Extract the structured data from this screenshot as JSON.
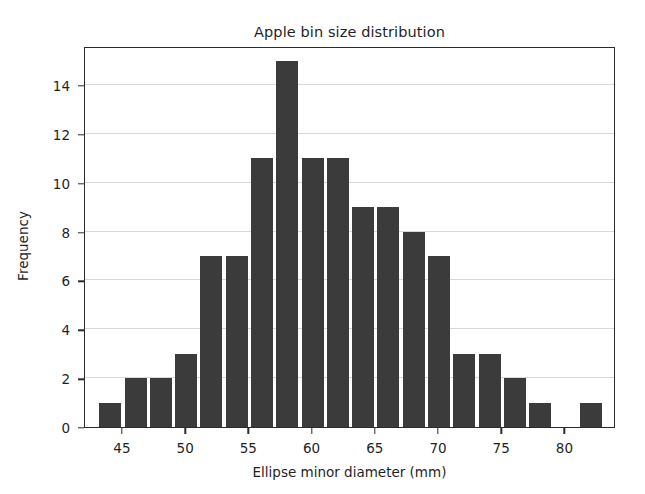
{
  "chart_data": {
    "type": "bar",
    "title": "Apple bin size distribution",
    "xlabel": "Ellipse minor diameter (mm)",
    "ylabel": "Frequency",
    "xlim": [
      42.0,
      84.0
    ],
    "ylim": [
      0,
      15.6
    ],
    "xticks": [
      45,
      50,
      55,
      60,
      65,
      70,
      75,
      80
    ],
    "yticks": [
      0,
      2,
      4,
      6,
      8,
      10,
      12,
      14
    ],
    "grid": true,
    "legend": "none",
    "bin_width": 2,
    "bar_color": "#3b3b3b",
    "bin_edges": [
      43,
      45,
      47,
      49,
      51,
      53,
      55,
      57,
      59,
      61,
      63,
      65,
      67,
      69,
      71,
      73,
      75,
      77,
      79,
      81
    ],
    "bin_centers": [
      44,
      46,
      48,
      50,
      52,
      54,
      56,
      58,
      60,
      62,
      64,
      66,
      68,
      70,
      72,
      74,
      76,
      78,
      80
    ],
    "values": [
      1,
      2,
      2,
      3,
      7,
      7,
      11,
      15,
      11,
      11,
      9,
      9,
      8,
      7,
      3,
      3,
      2,
      1,
      0,
      1
    ],
    "bars": [
      {
        "left": 43,
        "right": 45,
        "value": 1
      },
      {
        "left": 45,
        "right": 47,
        "value": 2
      },
      {
        "left": 47,
        "right": 49,
        "value": 2
      },
      {
        "left": 49,
        "right": 51,
        "value": 3
      },
      {
        "left": 51,
        "right": 53,
        "value": 7
      },
      {
        "left": 53,
        "right": 55,
        "value": 7
      },
      {
        "left": 55,
        "right": 57,
        "value": 11
      },
      {
        "left": 57,
        "right": 59,
        "value": 15
      },
      {
        "left": 59,
        "right": 61,
        "value": 11
      },
      {
        "left": 61,
        "right": 63,
        "value": 11
      },
      {
        "left": 63,
        "right": 65,
        "value": 9
      },
      {
        "left": 65,
        "right": 67,
        "value": 9
      },
      {
        "left": 67,
        "right": 69,
        "value": 8
      },
      {
        "left": 69,
        "right": 71,
        "value": 7
      },
      {
        "left": 71,
        "right": 73,
        "value": 3
      },
      {
        "left": 73,
        "right": 75,
        "value": 3
      },
      {
        "left": 75,
        "right": 77,
        "value": 2
      },
      {
        "left": 77,
        "right": 79,
        "value": 1
      },
      {
        "left": 79,
        "right": 81,
        "value": 0
      },
      {
        "left": 81,
        "right": 83,
        "value": 1
      }
    ]
  }
}
